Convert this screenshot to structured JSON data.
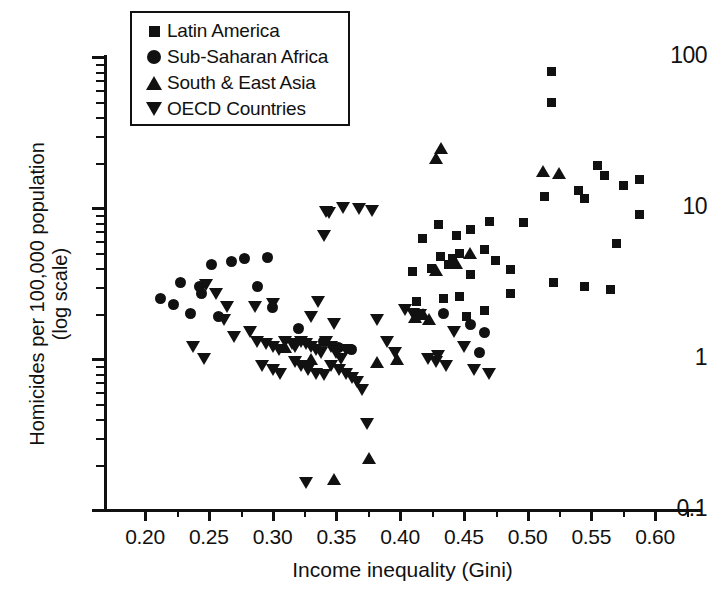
{
  "chart_data": {
    "type": "scatter",
    "title": "",
    "xlabel": "Income inequality (Gini)",
    "ylabel": "Homicides per 100,000 population (log scale)",
    "yscale": "log",
    "xlim": [
      0.195,
      0.615
    ],
    "ylim": [
      0.1,
      100
    ],
    "grid": false,
    "legend_position": "top-left",
    "xticks": [
      "0.20",
      "0.25",
      "0.30",
      "0.35",
      "0.40",
      "0.45",
      "0.50",
      "0.55",
      "0.60"
    ],
    "xtick_values": [
      0.2,
      0.25,
      0.3,
      0.35,
      0.4,
      0.45,
      0.5,
      0.55,
      0.6
    ],
    "xminor_step": 0.025,
    "yticks": [
      "0.1",
      "1",
      "10",
      "100"
    ],
    "ytick_values": [
      0.1,
      1,
      10,
      100
    ],
    "series": [
      {
        "name": "Latin America",
        "marker": "square",
        "points": [
          [
            0.519,
            80.0
          ],
          [
            0.519,
            50.0
          ],
          [
            0.555,
            19.0
          ],
          [
            0.56,
            16.5
          ],
          [
            0.588,
            15.5
          ],
          [
            0.575,
            14.0
          ],
          [
            0.54,
            13.0
          ],
          [
            0.513,
            12.0
          ],
          [
            0.545,
            11.5
          ],
          [
            0.588,
            9.0
          ],
          [
            0.47,
            8.2
          ],
          [
            0.497,
            8.0
          ],
          [
            0.43,
            7.8
          ],
          [
            0.455,
            7.2
          ],
          [
            0.444,
            6.6
          ],
          [
            0.418,
            6.3
          ],
          [
            0.466,
            5.3
          ],
          [
            0.447,
            5.0
          ],
          [
            0.432,
            4.8
          ],
          [
            0.441,
            4.6
          ],
          [
            0.475,
            4.5
          ],
          [
            0.438,
            4.2
          ],
          [
            0.425,
            4.0
          ],
          [
            0.487,
            3.9
          ],
          [
            0.41,
            3.8
          ],
          [
            0.455,
            3.6
          ],
          [
            0.57,
            5.8
          ],
          [
            0.52,
            3.2
          ],
          [
            0.545,
            3.0
          ],
          [
            0.565,
            2.9
          ],
          [
            0.487,
            2.7
          ],
          [
            0.447,
            2.6
          ],
          [
            0.434,
            2.5
          ],
          [
            0.413,
            2.4
          ],
          [
            0.466,
            2.1
          ],
          [
            0.452,
            1.9
          ]
        ]
      },
      {
        "name": "Sub-Saharan Africa",
        "marker": "circle",
        "points": [
          [
            0.212,
            2.5
          ],
          [
            0.222,
            2.3
          ],
          [
            0.228,
            3.2
          ],
          [
            0.236,
            2.0
          ],
          [
            0.244,
            2.7
          ],
          [
            0.252,
            4.2
          ],
          [
            0.243,
            3.0
          ],
          [
            0.258,
            1.9
          ],
          [
            0.268,
            4.4
          ],
          [
            0.278,
            4.6
          ],
          [
            0.288,
            3.0
          ],
          [
            0.296,
            4.7
          ],
          [
            0.3,
            2.2
          ],
          [
            0.32,
            1.6
          ],
          [
            0.34,
            1.3
          ],
          [
            0.352,
            1.2
          ],
          [
            0.362,
            1.15
          ],
          [
            0.455,
            1.7
          ],
          [
            0.466,
            1.5
          ],
          [
            0.462,
            1.1
          ],
          [
            0.434,
            2.0
          ]
        ]
      },
      {
        "name": "South & East Asia",
        "marker": "triangle-up",
        "points": [
          [
            0.432,
            25.0
          ],
          [
            0.428,
            21.5
          ],
          [
            0.512,
            17.5
          ],
          [
            0.525,
            17.0
          ],
          [
            0.455,
            5.0
          ],
          [
            0.444,
            4.3
          ],
          [
            0.428,
            3.9
          ],
          [
            0.418,
            2.0
          ],
          [
            0.412,
            1.9
          ],
          [
            0.423,
            1.85
          ],
          [
            0.398,
            1.0
          ],
          [
            0.382,
            0.95
          ],
          [
            0.348,
            0.16
          ],
          [
            0.376,
            0.22
          ],
          [
            0.33,
            1.0
          ],
          [
            0.31,
            1.2
          ]
        ]
      },
      {
        "name": "OECD Countries",
        "marker": "triangle-down",
        "points": [
          [
            0.355,
            10.0
          ],
          [
            0.368,
            9.8
          ],
          [
            0.378,
            9.5
          ],
          [
            0.342,
            9.4
          ],
          [
            0.344,
            9.2
          ],
          [
            0.34,
            6.5
          ],
          [
            0.248,
            3.1
          ],
          [
            0.256,
            2.7
          ],
          [
            0.264,
            2.2
          ],
          [
            0.262,
            1.8
          ],
          [
            0.27,
            1.4
          ],
          [
            0.238,
            1.2
          ],
          [
            0.246,
            1.0
          ],
          [
            0.282,
            1.5
          ],
          [
            0.288,
            1.3
          ],
          [
            0.295,
            1.25
          ],
          [
            0.3,
            1.2
          ],
          [
            0.305,
            1.15
          ],
          [
            0.31,
            1.3
          ],
          [
            0.315,
            1.25
          ],
          [
            0.318,
            1.2
          ],
          [
            0.322,
            1.3
          ],
          [
            0.326,
            1.25
          ],
          [
            0.33,
            1.2
          ],
          [
            0.334,
            1.15
          ],
          [
            0.338,
            1.1
          ],
          [
            0.342,
            1.3
          ],
          [
            0.346,
            1.2
          ],
          [
            0.35,
            1.1
          ],
          [
            0.354,
            1.0
          ],
          [
            0.358,
            1.15
          ],
          [
            0.33,
            1.9
          ],
          [
            0.336,
            2.4
          ],
          [
            0.348,
            1.7
          ],
          [
            0.318,
            0.95
          ],
          [
            0.322,
            0.9
          ],
          [
            0.328,
            0.85
          ],
          [
            0.334,
            0.8
          ],
          [
            0.34,
            0.78
          ],
          [
            0.346,
            0.9
          ],
          [
            0.352,
            0.85
          ],
          [
            0.358,
            0.8
          ],
          [
            0.362,
            0.75
          ],
          [
            0.366,
            0.7
          ],
          [
            0.37,
            0.62
          ],
          [
            0.374,
            0.37
          ],
          [
            0.326,
            0.15
          ],
          [
            0.3,
            0.85
          ],
          [
            0.306,
            0.8
          ],
          [
            0.292,
            0.9
          ],
          [
            0.382,
            1.8
          ],
          [
            0.39,
            1.3
          ],
          [
            0.396,
            1.1
          ],
          [
            0.404,
            2.1
          ],
          [
            0.41,
            2.0
          ],
          [
            0.416,
            1.95
          ],
          [
            0.422,
            1.0
          ],
          [
            0.428,
            0.95
          ],
          [
            0.436,
            0.9
          ],
          [
            0.442,
            1.5
          ],
          [
            0.45,
            1.2
          ],
          [
            0.458,
            0.85
          ],
          [
            0.47,
            0.8
          ],
          [
            0.3,
            2.3
          ],
          [
            0.286,
            2.2
          ],
          [
            0.43,
            1.05
          ]
        ]
      }
    ]
  },
  "legend": {
    "items": [
      {
        "label": "Latin America",
        "marker": "square"
      },
      {
        "label": "Sub-Saharan Africa",
        "marker": "circle"
      },
      {
        "label": "South & East Asia",
        "marker": "triangle-up"
      },
      {
        "label": "OECD Countries",
        "marker": "triangle-down"
      }
    ]
  },
  "axes": {
    "x_title": "Income inequality (Gini)",
    "y_title_line1": "Homicides per 100,000 population",
    "y_title_line2": "(log scale)"
  }
}
